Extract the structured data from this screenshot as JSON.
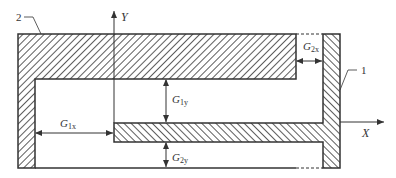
{
  "diagram": {
    "axes": {
      "x_label": "X",
      "y_label": "Y"
    },
    "parts": [
      {
        "id": "1",
        "label": "1",
        "description": "right vertical member with horizontal T-bar"
      },
      {
        "id": "2",
        "label": "2",
        "description": "outer C-shaped housing"
      }
    ],
    "gaps": [
      {
        "id": "G1x",
        "base": "G",
        "sub": "1x"
      },
      {
        "id": "G1y",
        "base": "G",
        "sub": "1y"
      },
      {
        "id": "G2x",
        "base": "G",
        "sub": "2x"
      },
      {
        "id": "G2y",
        "base": "G",
        "sub": "2y"
      }
    ],
    "colors": {
      "stroke": "#333333",
      "hatch": "#333333",
      "background": "#ffffff"
    }
  }
}
